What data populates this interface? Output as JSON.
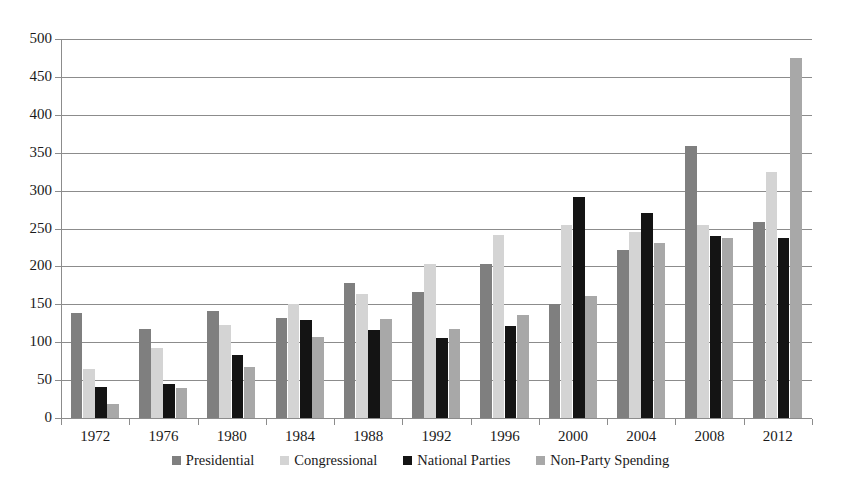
{
  "chart_data": {
    "type": "bar",
    "title": "",
    "subtitle": "",
    "xlabel": "",
    "ylabel": "",
    "ylim": [
      0,
      500
    ],
    "ytick_step": 50,
    "yticks": [
      500,
      450,
      400,
      350,
      300,
      250,
      200,
      150,
      100,
      50,
      0
    ],
    "grid": true,
    "legend_position": "bottom",
    "categories": [
      "1972",
      "1976",
      "1980",
      "1984",
      "1988",
      "1992",
      "1996",
      "2000",
      "2004",
      "2008",
      "2012"
    ],
    "series": [
      {
        "name": "Presidential",
        "color": "#7f7f7f",
        "values": [
          138,
          118,
          141,
          132,
          178,
          166,
          203,
          150,
          221,
          359,
          258
        ]
      },
      {
        "name": "Congressional",
        "color": "#d4d4d4",
        "values": [
          65,
          93,
          123,
          151,
          163,
          203,
          241,
          255,
          246,
          255,
          325
        ]
      },
      {
        "name": "National Parties",
        "color": "#141414",
        "values": [
          41,
          45,
          83,
          129,
          116,
          105,
          122,
          292,
          271,
          240,
          237
        ]
      },
      {
        "name": "Non-Party Spending",
        "color": "#a8a8a8",
        "values": [
          19,
          39,
          67,
          107,
          131,
          117,
          136,
          161,
          231,
          237,
          475
        ]
      }
    ]
  },
  "legend": {
    "items": [
      {
        "label": "Presidential"
      },
      {
        "label": "Congressional"
      },
      {
        "label": "National Parties"
      },
      {
        "label": "Non-Party Spending"
      }
    ]
  },
  "axes": {
    "y": {
      "labels": [
        "500",
        "450",
        "400",
        "350",
        "300",
        "250",
        "200",
        "150",
        "100",
        "50",
        "0"
      ]
    },
    "x": {
      "labels": [
        "1972",
        "1976",
        "1980",
        "1984",
        "1988",
        "1992",
        "1996",
        "2000",
        "2004",
        "2008",
        "2012"
      ]
    }
  }
}
